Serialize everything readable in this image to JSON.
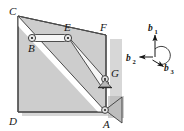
{
  "figure": {
    "type": "engineering-statics-frame-diagram",
    "caption": "",
    "colors": {
      "body_fill": "#cdcdcd",
      "body_stroke": "#4a4a4a",
      "link_fill": "#f4f4f4",
      "link_stroke": "#3b3b3b",
      "support_fill": "#b4b4b4",
      "shadow": "#a8a8a8",
      "label_color": "#161616",
      "background": "#ffffff"
    },
    "geometry": {
      "vertices": {
        "C": {
          "x": 18,
          "y": 16
        },
        "D": {
          "x": 18,
          "y": 112
        },
        "A": {
          "x": 106,
          "y": 112
        },
        "G": {
          "x": 106,
          "y": 78
        },
        "F": {
          "x": 106,
          "y": 35
        }
      },
      "joints": {
        "B": {
          "x": 32,
          "y": 38
        },
        "E": {
          "x": 68,
          "y": 38
        },
        "G": {
          "x": 105,
          "y": 79
        },
        "A": {
          "x": 105,
          "y": 110
        }
      }
    },
    "labels": [
      {
        "name": "label-C",
        "text": "C",
        "x": 9,
        "y": 14
      },
      {
        "name": "label-B",
        "text": "B",
        "x": 29,
        "y": 52
      },
      {
        "name": "label-E",
        "text": "E",
        "x": 64,
        "y": 31
      },
      {
        "name": "label-F",
        "text": "F",
        "x": 101,
        "y": 31
      },
      {
        "name": "label-G",
        "text": "G",
        "x": 112,
        "y": 76
      },
      {
        "name": "label-D",
        "text": "D",
        "x": 9,
        "y": 124
      },
      {
        "name": "label-A",
        "text": "A",
        "x": 104,
        "y": 127
      }
    ],
    "members": [
      {
        "name": "link-BE",
        "from": "B",
        "to": "E",
        "kind": "two-force-link"
      },
      {
        "name": "link-EG",
        "from": "E",
        "to": "G",
        "kind": "two-force-link"
      },
      {
        "name": "edge-CA",
        "from": "C",
        "to": "A",
        "kind": "body-edge"
      }
    ],
    "supports": [
      {
        "name": "support-G",
        "type": "rocker",
        "at": "G"
      },
      {
        "name": "support-A",
        "type": "pin-bracket",
        "at": "A"
      }
    ]
  },
  "vector_triad": {
    "origin": {
      "x": 155,
      "y": 58
    },
    "arc_radius": 9,
    "vectors": [
      {
        "name": "b1",
        "base": "b",
        "sub": "1",
        "direction": "up",
        "label_x": 148,
        "label_y": 31,
        "sub_x": 156.5,
        "sub_y": 33.5,
        "tip_x": 155,
        "tip_y": 34
      },
      {
        "name": "b2",
        "base": "b",
        "sub": "2",
        "direction": "left",
        "label_x": 126,
        "label_y": 60,
        "sub_x": 134.5,
        "sub_y": 62.5,
        "tip_x": 139,
        "tip_y": 57
      },
      {
        "name": "b3",
        "base": "b",
        "sub": "3",
        "direction": "lower-right",
        "label_x": 164,
        "label_y": 70,
        "sub_x": 172.5,
        "sub_y": 72.5,
        "tip_x": 163,
        "tip_y": 66
      }
    ]
  }
}
